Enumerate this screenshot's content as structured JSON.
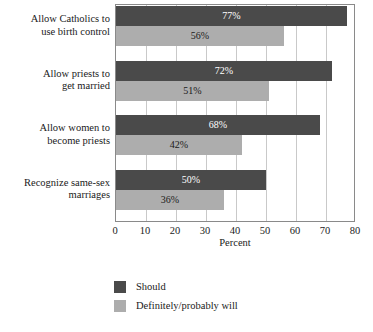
{
  "chart_data": {
    "type": "bar",
    "orientation": "horizontal",
    "title": "",
    "xlabel": "Percent",
    "ylabel": "",
    "xlim": [
      0,
      80
    ],
    "xticks": [
      0,
      10,
      20,
      30,
      40,
      50,
      60,
      70,
      80
    ],
    "xtick_labels": [
      "0",
      "10",
      "20",
      "30",
      "40",
      "50",
      "60",
      "70",
      "80"
    ],
    "grid": true,
    "grid_axis": "x",
    "legend_position": "bottom-left",
    "categories": [
      "Allow Catholics to\nuse birth control",
      "Allow priests to\nget married",
      "Allow women to\nbecome priests",
      "Recognize same-sex\nmarriages"
    ],
    "category_lines": [
      [
        "Allow Catholics to",
        "use birth control"
      ],
      [
        "Allow priests to",
        "get married"
      ],
      [
        "Allow women to",
        "become priests"
      ],
      [
        "Recognize same-sex",
        "marriages"
      ]
    ],
    "series": [
      {
        "name": "Should",
        "color": "#4a4a4a",
        "values": [
          77,
          72,
          68,
          50
        ],
        "labels": [
          "77%",
          "72%",
          "68%",
          "50%"
        ]
      },
      {
        "name": "Definitely/probably will",
        "color": "#adadad",
        "values": [
          56,
          51,
          42,
          36
        ],
        "labels": [
          "56%",
          "51%",
          "42%",
          "36%"
        ]
      }
    ]
  },
  "legend": {
    "items": [
      {
        "label": "Should",
        "color": "#4a4a4a"
      },
      {
        "label": "Definitely/probably will",
        "color": "#adadad"
      }
    ]
  },
  "colors": {
    "should": "#4a4a4a",
    "will": "#adadad",
    "gridline": "#c9c9c9",
    "frame": "#8a8a8a",
    "background": "#ffffff",
    "text": "#1a1a1a"
  }
}
